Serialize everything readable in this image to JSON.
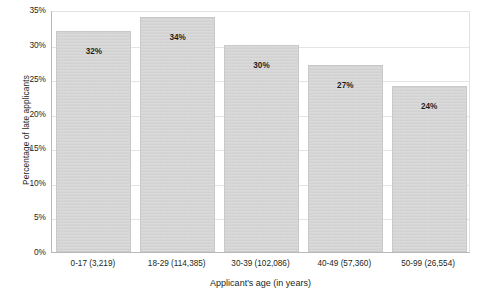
{
  "chart_data": {
    "type": "bar",
    "title": "",
    "xlabel": "Applicant's age (in years)",
    "ylabel": "Percentage of late applicants",
    "categories": [
      "0-17 (3,219)",
      "18-29 (114,385)",
      "30-39 (102,086)",
      "40-49 (57,360)",
      "50-99 (26,554)"
    ],
    "values": [
      32,
      34,
      30,
      27,
      24
    ],
    "value_labels": [
      "32%",
      "34%",
      "30%",
      "27%",
      "24%"
    ],
    "group_counts": [
      3219,
      114385,
      102086,
      57360,
      26554
    ],
    "age_ranges": [
      "0-17",
      "18-29",
      "30-39",
      "40-49",
      "50-99"
    ],
    "ylim": [
      0,
      35
    ],
    "ytick_values": [
      0,
      5,
      10,
      15,
      20,
      25,
      30,
      35
    ],
    "ytick_labels": [
      "0%",
      "5%",
      "10%",
      "15%",
      "20%",
      "25%",
      "30%",
      "35%"
    ],
    "grid": true,
    "legend": "none",
    "bar_color": "#d2d2d2",
    "bar_border_color": "#c9c9c9",
    "grid_color": "#e4e4e4",
    "axis_color": "#b8b8b8",
    "text_color": "#231f20",
    "background": "#ffffff"
  }
}
